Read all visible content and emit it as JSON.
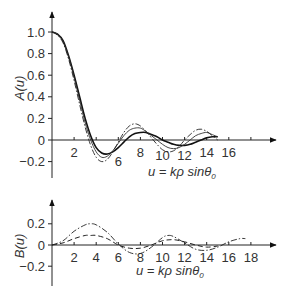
{
  "chart_data": [
    {
      "type": "line",
      "panel": "upper",
      "ylabel": "A(u)",
      "xlabel": "u = kρ sinθ0",
      "yticks": [
        "1.0",
        "0.8",
        "0.6",
        "0.4",
        "0.2",
        "0",
        "-0.2"
      ],
      "ytick_values": [
        1.0,
        0.8,
        0.6,
        0.4,
        0.2,
        0,
        -0.2
      ],
      "xticks": [
        "2",
        "6",
        "8",
        "10",
        "12",
        "14",
        "16"
      ],
      "xtick_values": [
        2,
        6,
        8,
        10,
        12,
        14,
        16
      ],
      "xlim": [
        0,
        20
      ],
      "ylim": [
        -0.3,
        1.1
      ],
      "grid": false,
      "legend": "none",
      "series": [
        {
          "name": "solid",
          "style": "solid",
          "x": [
            0,
            0.5,
            1,
            1.5,
            2,
            2.5,
            3,
            3.5,
            4,
            4.5,
            5,
            5.5,
            6,
            6.5,
            7,
            7.5,
            8,
            8.5,
            9,
            9.5,
            10,
            10.5,
            11,
            11.5,
            12,
            12.5,
            13,
            13.5,
            14,
            14.5,
            15
          ],
          "y": [
            1.0,
            0.98,
            0.92,
            0.78,
            0.6,
            0.4,
            0.2,
            0.04,
            -0.07,
            -0.12,
            -0.13,
            -0.11,
            -0.07,
            -0.02,
            0.03,
            0.06,
            0.07,
            0.07,
            0.05,
            0.03,
            0.0,
            -0.02,
            -0.04,
            -0.05,
            -0.05,
            -0.04,
            -0.02,
            0.0,
            0.02,
            0.03,
            0.03
          ]
        },
        {
          "name": "thin-solid",
          "style": "thin",
          "x": [
            0,
            0.5,
            1,
            1.5,
            2,
            2.5,
            3,
            3.5,
            4,
            4.5,
            5,
            5.5,
            6,
            6.5,
            7,
            7.5,
            8,
            8.5,
            9,
            9.5,
            10,
            10.5,
            11,
            11.5,
            12,
            12.5,
            13,
            13.5,
            14,
            14.5,
            15
          ],
          "y": [
            1.0,
            0.98,
            0.91,
            0.77,
            0.58,
            0.37,
            0.16,
            0.0,
            -0.11,
            -0.16,
            -0.15,
            -0.1,
            -0.03,
            0.04,
            0.09,
            0.11,
            0.11,
            0.08,
            0.04,
            0.0,
            -0.04,
            -0.07,
            -0.08,
            -0.07,
            -0.04,
            0.0,
            0.04,
            0.06,
            0.07,
            0.05,
            0.03
          ]
        },
        {
          "name": "dash-dot",
          "style": "dash-dot",
          "x": [
            0,
            0.5,
            1,
            1.5,
            2,
            2.5,
            3,
            3.5,
            4,
            4.5,
            5,
            5.5,
            6,
            6.5,
            7,
            7.5,
            8,
            8.5,
            9,
            9.5,
            10,
            10.5,
            11,
            11.5,
            12,
            12.5,
            13,
            13.5,
            14,
            14.5,
            15
          ],
          "y": [
            1.0,
            0.97,
            0.9,
            0.75,
            0.55,
            0.33,
            0.12,
            -0.05,
            -0.16,
            -0.2,
            -0.18,
            -0.11,
            -0.02,
            0.07,
            0.13,
            0.15,
            0.13,
            0.08,
            0.02,
            -0.04,
            -0.09,
            -0.11,
            -0.1,
            -0.06,
            0.0,
            0.05,
            0.09,
            0.1,
            0.08,
            0.04,
            0.0
          ]
        }
      ]
    },
    {
      "type": "line",
      "panel": "lower",
      "ylabel": "B(u)",
      "xlabel": "u = kρ sinθ0",
      "yticks": [
        "0.2",
        "0",
        "-0.2"
      ],
      "ytick_values": [
        0.2,
        0,
        -0.2
      ],
      "xticks": [
        "2",
        "4",
        "6",
        "8",
        "10",
        "12",
        "14",
        "16",
        "18"
      ],
      "xtick_values": [
        2,
        4,
        6,
        8,
        10,
        12,
        14,
        16,
        18
      ],
      "xlim": [
        0,
        20
      ],
      "ylim": [
        -0.35,
        0.38
      ],
      "grid": false,
      "legend": "none",
      "series": [
        {
          "name": "dash-dot",
          "style": "dash-dot",
          "x": [
            0,
            1,
            2,
            3,
            3.5,
            4,
            5,
            6,
            7,
            8,
            9,
            10,
            10.5,
            11,
            12,
            13,
            14,
            15,
            16,
            17,
            17.5
          ],
          "y": [
            0.0,
            0.04,
            0.13,
            0.19,
            0.2,
            0.19,
            0.12,
            0.01,
            -0.07,
            -0.08,
            -0.02,
            0.07,
            0.09,
            0.08,
            0.02,
            -0.04,
            -0.05,
            -0.02,
            0.03,
            0.06,
            0.06
          ]
        },
        {
          "name": "dashed",
          "style": "dashed",
          "x": [
            0,
            1,
            2,
            3,
            3.5,
            4,
            5,
            6,
            7,
            8,
            9,
            10,
            11,
            12,
            13,
            14,
            15
          ],
          "y": [
            0.0,
            0.02,
            0.06,
            0.09,
            0.09,
            0.09,
            0.06,
            0.0,
            -0.03,
            -0.03,
            0.0,
            0.04,
            0.05,
            0.03,
            0.0,
            -0.02,
            -0.01
          ]
        }
      ]
    }
  ],
  "labels": {
    "upper_ylabel": "A(u)",
    "lower_ylabel": "B(u)",
    "xlabel_prefix": "u = kρ sinθ",
    "xlabel_subscript": "0"
  }
}
